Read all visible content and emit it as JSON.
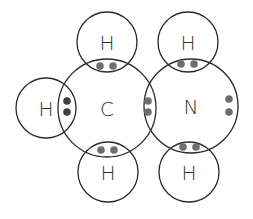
{
  "colors": {
    "outline": "#2a2a2a",
    "label": "#333333",
    "electron": "#6e6e6e",
    "electron_dark": "#3f3f3f"
  },
  "atoms": [
    {
      "id": "c",
      "symbol": "C",
      "cx": 107,
      "cy": 108,
      "r": 49
    },
    {
      "id": "n",
      "symbol": "N",
      "cx": 191,
      "cy": 106,
      "r": 47
    },
    {
      "id": "h-left",
      "symbol": "H",
      "cx": 46,
      "cy": 108,
      "r": 30
    },
    {
      "id": "h-top-c",
      "symbol": "H",
      "cx": 107,
      "cy": 42,
      "r": 30
    },
    {
      "id": "h-bottom-c",
      "symbol": "H",
      "cx": 108,
      "cy": 172,
      "r": 30
    },
    {
      "id": "h-top-n",
      "symbol": "H",
      "cx": 188,
      "cy": 42,
      "r": 30
    },
    {
      "id": "h-bottom-n",
      "symbol": "H",
      "cx": 189,
      "cy": 172,
      "r": 30
    }
  ],
  "electron_pairs": [
    {
      "id": "c-h-left",
      "type": "bond",
      "dots": [
        [
          67,
          101
        ],
        [
          67,
          112
        ]
      ],
      "dark": true
    },
    {
      "id": "c-h-top",
      "type": "bond",
      "dots": [
        [
          100,
          66
        ],
        [
          113,
          66
        ]
      ],
      "dark": false
    },
    {
      "id": "c-h-bottom",
      "type": "bond",
      "dots": [
        [
          101,
          150
        ],
        [
          114,
          150
        ]
      ],
      "dark": false
    },
    {
      "id": "c-n",
      "type": "bond",
      "dots": [
        [
          148,
          101
        ],
        [
          148,
          112
        ]
      ],
      "dark": false
    },
    {
      "id": "n-h-top",
      "type": "bond",
      "dots": [
        [
          181,
          64
        ],
        [
          194,
          64
        ]
      ],
      "dark": false
    },
    {
      "id": "n-h-bottom",
      "type": "bond",
      "dots": [
        [
          183,
          147
        ],
        [
          196,
          147
        ]
      ],
      "dark": false
    },
    {
      "id": "n-lone-pair",
      "type": "lone-pair",
      "dots": [
        [
          229,
          99
        ],
        [
          229,
          112
        ]
      ],
      "dark": false
    }
  ]
}
